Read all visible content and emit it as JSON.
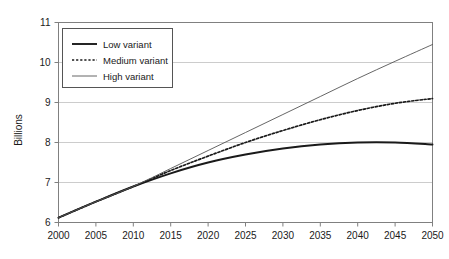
{
  "chart_data": {
    "type": "line",
    "title": "",
    "subtitle": "",
    "xlabel": "",
    "ylabel": "Billions",
    "xlim": [
      2000,
      2050
    ],
    "ylim": [
      6,
      11
    ],
    "grid": true,
    "grid_axis": "y",
    "legend_position": "top-left-inside",
    "x_ticks": [
      2000,
      2005,
      2010,
      2015,
      2020,
      2025,
      2030,
      2035,
      2040,
      2045,
      2050
    ],
    "y_ticks": [
      6,
      7,
      8,
      9,
      10,
      11
    ],
    "x": [
      2000,
      2005,
      2010,
      2015,
      2020,
      2025,
      2030,
      2035,
      2040,
      2045,
      2050
    ],
    "series": [
      {
        "name": "Low variant",
        "style": "solid-thick",
        "color": "#1a1a1a",
        "values": [
          6.12,
          6.52,
          6.9,
          7.23,
          7.5,
          7.7,
          7.85,
          7.95,
          8.0,
          8.0,
          7.95
        ]
      },
      {
        "name": "Medium variant",
        "style": "dotted",
        "color": "#1a1a1a",
        "values": [
          6.12,
          6.52,
          6.9,
          7.3,
          7.66,
          8.0,
          8.3,
          8.57,
          8.8,
          8.98,
          9.1
        ]
      },
      {
        "name": "High variant",
        "style": "solid-thin",
        "color": "#555555",
        "values": [
          6.12,
          6.52,
          6.9,
          7.35,
          7.8,
          8.25,
          8.7,
          9.15,
          9.6,
          10.03,
          10.45
        ]
      }
    ]
  },
  "axes": {
    "y_title": "Billions",
    "y_tick_labels": [
      "11",
      "10",
      "9",
      "8",
      "7",
      "6"
    ],
    "x_tick_labels": [
      "2000",
      "2005",
      "2010",
      "2015",
      "2020",
      "2025",
      "2030",
      "2035",
      "2040",
      "2045",
      "2050"
    ]
  },
  "legend": {
    "entries": [
      {
        "label": "Low variant",
        "swatch": "solid-thick"
      },
      {
        "label": "Medium variant",
        "swatch": "dotted"
      },
      {
        "label": "High variant",
        "swatch": "solid-thin"
      }
    ]
  },
  "colors": {
    "gridline": "#cccccc",
    "frame": "#808080",
    "text": "#1a1a1a",
    "low": "#1a1a1a",
    "medium": "#1a1a1a",
    "high": "#555555",
    "background": "#ffffff"
  }
}
